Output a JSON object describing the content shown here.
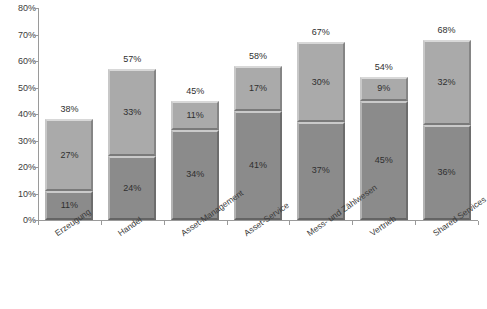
{
  "chart_data": {
    "type": "bar",
    "stacked": true,
    "title": "",
    "subtitle": "",
    "xlabel": "",
    "ylabel": "",
    "ylim": [
      0,
      80
    ],
    "ytick_labels": [
      "0%",
      "10%",
      "20%",
      "30%",
      "40%",
      "50%",
      "60%",
      "70%",
      "80%"
    ],
    "ytick_values": [
      0,
      10,
      20,
      30,
      40,
      50,
      60,
      70,
      80
    ],
    "grid": false,
    "legend": "none",
    "value_suffix": "%",
    "categories": [
      "Erzeugung",
      "Handel",
      "Asset-Management",
      "Asset-Service",
      "Mess- und Zählwesen",
      "Vertrieb",
      "Shared Services"
    ],
    "series": [
      {
        "name": "lower-segment",
        "color": "#8b8b8b",
        "values": [
          11,
          24,
          34,
          41,
          37,
          45,
          36
        ],
        "labels": [
          "11%",
          "24%",
          "34%",
          "41%",
          "37%",
          "45%",
          "36%"
        ]
      },
      {
        "name": "upper-segment",
        "color": "#aaaaaa",
        "values": [
          27,
          33,
          11,
          17,
          30,
          9,
          32
        ],
        "labels": [
          "27%",
          "33%",
          "11%",
          "17%",
          "30%",
          "9%",
          "32%"
        ]
      }
    ],
    "totals": [
      38,
      57,
      45,
      58,
      67,
      54,
      68
    ],
    "total_labels": [
      "38%",
      "57%",
      "45%",
      "58%",
      "67%",
      "54%",
      "68%"
    ]
  },
  "colors": {
    "background": "#ffffff",
    "axis": "#9a9a9a",
    "text": "#2f2f2f",
    "lower_segment": "#8b8b8b",
    "upper_segment": "#aaaaaa"
  }
}
